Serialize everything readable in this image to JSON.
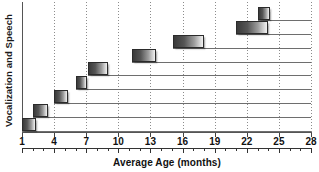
{
  "chart_data": {
    "type": "bar",
    "orientation": "horizontal",
    "title": "",
    "xlabel": "Average Age (months)",
    "ylabel": "Vocalization and Speech",
    "xlim": [
      1,
      28
    ],
    "xticks": [
      1,
      4,
      7,
      10,
      13,
      16,
      19,
      22,
      25,
      28
    ],
    "xtick_labels": [
      "1",
      "4",
      "7",
      "10",
      "13",
      "16",
      "19",
      "22",
      "25",
      "28"
    ],
    "minor_tick_interval": 1,
    "grid": "vertical-dotted",
    "legend": "none",
    "bar_style": "gradient dark-left to light-right",
    "rows": 9,
    "categories": [
      "milestone-1",
      "milestone-2",
      "milestone-3",
      "milestone-4",
      "milestone-5",
      "milestone-6",
      "milestone-7",
      "milestone-8",
      "milestone-9"
    ],
    "bars": [
      {
        "row": 1,
        "start": 1.0,
        "end": 2.3
      },
      {
        "row": 2,
        "start": 2.0,
        "end": 3.4
      },
      {
        "row": 3,
        "start": 4.0,
        "end": 5.3
      },
      {
        "row": 4,
        "start": 6.0,
        "end": 7.1
      },
      {
        "row": 5,
        "start": 7.2,
        "end": 9.0
      },
      {
        "row": 6,
        "start": 11.3,
        "end": 13.5
      },
      {
        "row": 7,
        "start": 15.1,
        "end": 18.0
      },
      {
        "row": 8,
        "start": 21.0,
        "end": 24.0
      },
      {
        "row": 9,
        "start": 23.0,
        "end": 24.2
      }
    ],
    "values": [
      1.3,
      1.4,
      1.3,
      1.1,
      1.8,
      2.2,
      2.9,
      3.0,
      1.2
    ]
  },
  "axes": {
    "x_title": "Average Age (months)",
    "y_title": "Vocalization and Speech"
  }
}
